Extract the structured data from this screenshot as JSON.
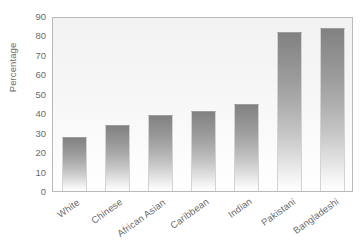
{
  "chart_data": {
    "type": "bar",
    "title": "",
    "xlabel": "",
    "ylabel": "Percentage",
    "categories": [
      "White",
      "Chinese",
      "African Asian",
      "Caribbean",
      "Indian",
      "Pakistani",
      "Bangladeshi"
    ],
    "values": [
      28,
      34,
      39,
      41,
      45,
      82,
      84
    ],
    "ylim": [
      0,
      90
    ],
    "ytick_labels": [
      "0",
      "10",
      "20",
      "30",
      "40",
      "50",
      "60",
      "70",
      "80",
      "90"
    ],
    "ytick_values": [
      0,
      10,
      20,
      30,
      40,
      50,
      60,
      70,
      80,
      90
    ],
    "grid": false,
    "legend": "none",
    "bar_fill": "#8c8c8c",
    "bar_fill_bottom": "#ffffff",
    "plot_background": "#f2f2f2",
    "axis_color": "#b9b9b9",
    "text_color": "#6b6b6b"
  }
}
